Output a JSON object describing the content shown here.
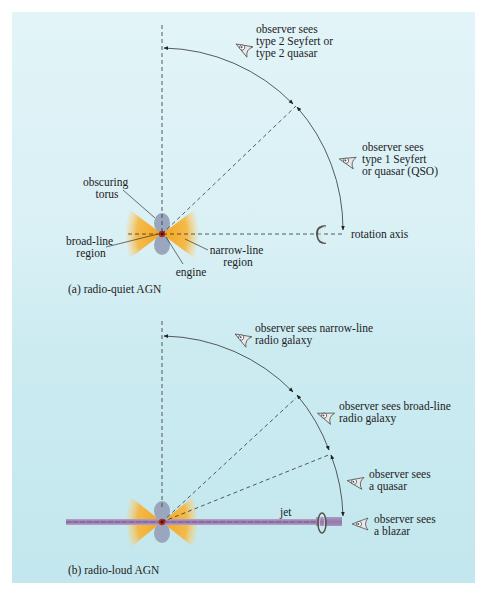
{
  "figure": {
    "panel_a": {
      "caption": "(a)  radio-quiet AGN",
      "labels": {
        "obscuring_torus_1": "obscuring",
        "obscuring_torus_2": "torus",
        "broad_line_1": "broad-line",
        "broad_line_2": "region",
        "narrow_line_1": "narrow-line",
        "narrow_line_2": "region",
        "engine": "engine",
        "rotation_axis": "rotation axis"
      },
      "observers": [
        {
          "lines": [
            "observer sees",
            "type 2 Seyfert or",
            "type 2 quasar"
          ],
          "icon": "eye-icon"
        },
        {
          "lines": [
            "observer sees",
            "type 1 Seyfert",
            "or quasar (QSO)"
          ],
          "icon": "eye-icon"
        }
      ]
    },
    "panel_b": {
      "caption": "(b)  radio-loud AGN",
      "labels": {
        "jet": "jet"
      },
      "observers": [
        {
          "lines": [
            "observer sees narrow-line",
            "radio galaxy"
          ],
          "icon": "eye-icon"
        },
        {
          "lines": [
            "observer sees broad-line",
            "radio galaxy"
          ],
          "icon": "eye-icon"
        },
        {
          "lines": [
            "observer sees",
            "a quasar"
          ],
          "icon": "eye-icon"
        },
        {
          "lines": [
            "observer sees",
            "a blazar"
          ],
          "icon": "eye-icon"
        }
      ]
    },
    "colors": {
      "background_top": "#e2f4f8",
      "background_bottom": "#c3e7ee",
      "cone": "#f5b02a",
      "torus": "#9aa6bd",
      "engine": "#c0281c",
      "jet": "#9a7fae",
      "line": "#333333"
    }
  }
}
